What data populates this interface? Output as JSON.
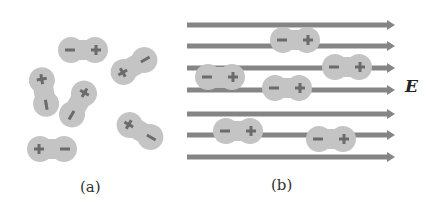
{
  "panels": {
    "a": {
      "caption": "(a)"
    },
    "b": {
      "caption": "(b)",
      "field_label": "E"
    }
  },
  "colors": {
    "dipole_fill": "#c4c4c4",
    "sign": "#6b6b6b",
    "arrow": "#858585",
    "text": "#222222"
  },
  "signs": {
    "plus": "+",
    "minus": "−"
  }
}
